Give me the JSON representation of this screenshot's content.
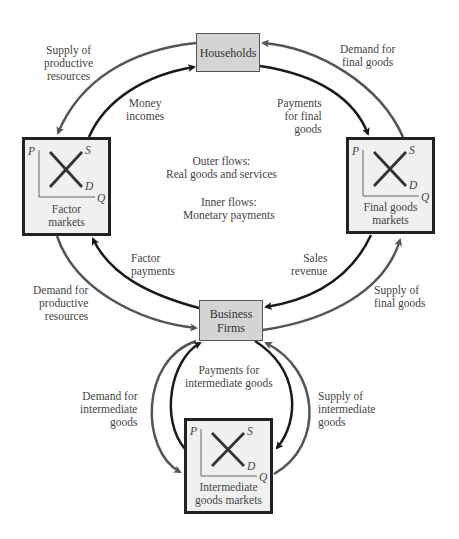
{
  "diagram": {
    "nodes": {
      "households": "Households",
      "business_firms": [
        "Business",
        "Firms"
      ]
    },
    "markets": {
      "factor": {
        "caption": [
          "Factor",
          "markets"
        ],
        "axis_p": "P",
        "axis_q": "Q",
        "supply": "S",
        "demand": "D"
      },
      "final_goods": {
        "caption": [
          "Final goods",
          "markets"
        ],
        "axis_p": "P",
        "axis_q": "Q",
        "supply": "S",
        "demand": "D"
      },
      "intermediate": {
        "caption": [
          "Intermediate",
          "goods markets"
        ],
        "axis_p": "P",
        "axis_q": "Q",
        "supply": "S",
        "demand": "D"
      }
    },
    "flow_labels": {
      "supply_productive": [
        "Supply of",
        "productive",
        "resources"
      ],
      "money_incomes": [
        "Money",
        "incomes"
      ],
      "demand_final": [
        "Demand for",
        "final goods"
      ],
      "payments_final": [
        "Payments",
        "for final",
        "goods"
      ],
      "factor_payments": [
        "Factor",
        "payments"
      ],
      "demand_productive": [
        "Demand for",
        "productive",
        "resources"
      ],
      "sales_revenue": [
        "Sales",
        "revenue"
      ],
      "supply_final": [
        "Supply of",
        "final goods"
      ],
      "demand_intermediate": [
        "Demand for",
        "intermediate",
        "goods"
      ],
      "payments_intermediate": [
        "Payments for",
        "intermediate goods"
      ],
      "supply_intermediate": [
        "Supply of",
        "intermediate",
        "goods"
      ]
    },
    "legend": {
      "outer": [
        "Outer flows:",
        "Real goods and services"
      ],
      "inner": [
        "Inner flows:",
        "Monetary payments"
      ]
    },
    "colors": {
      "outer_flow": "#555555",
      "inner_flow": "#1a1a1a",
      "node_fill": "#d4d4d4",
      "market_fill": "#f0f0f0"
    }
  }
}
